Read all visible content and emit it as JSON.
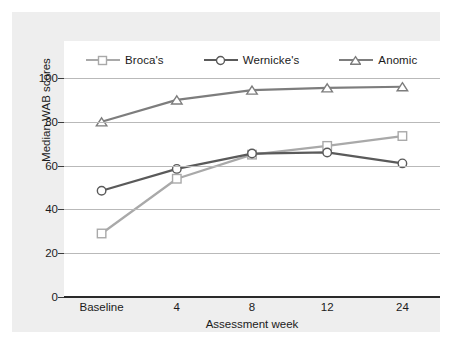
{
  "chart_data": {
    "type": "line",
    "title": "",
    "xlabel": "Assessment week",
    "ylabel": "Median WAB scores",
    "categories": [
      "Baseline",
      "4",
      "8",
      "12",
      "24"
    ],
    "ylim": [
      0,
      100
    ],
    "yticks": [
      0,
      20,
      40,
      60,
      80,
      100
    ],
    "grid": true,
    "legend_position": "top",
    "series": [
      {
        "name": "Broca's",
        "marker": "square",
        "color": "#a9a9a9",
        "values": [
          29,
          54,
          65,
          69,
          73.5
        ]
      },
      {
        "name": "Wernicke's",
        "marker": "circle",
        "color": "#5a5a5a",
        "values": [
          48.5,
          58.5,
          65.5,
          66,
          61
        ]
      },
      {
        "name": "Anomic",
        "marker": "triangle",
        "color": "#7d7d7d",
        "values": [
          80,
          90,
          94.5,
          95.5,
          96
        ]
      }
    ]
  },
  "colors": {
    "panel_background": "#eeeeee",
    "plot_background": "#ffffff",
    "gridline": "#b9b9b9",
    "axis": "#2a2a2a",
    "text": "#1b1b1b"
  }
}
